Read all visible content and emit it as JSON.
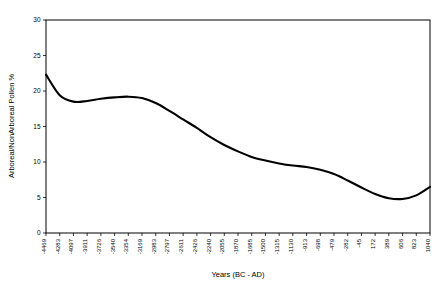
{
  "chart_data": {
    "type": "line",
    "title": "",
    "subtitle": "",
    "xlabel": "Years (BC - AD)",
    "ylabel": "Arboreal/NonArboreal Pollen %",
    "ylim": [
      0,
      30
    ],
    "yticks": [
      0,
      5,
      10,
      15,
      20,
      25,
      30
    ],
    "ytick_labels": [
      "0",
      "5",
      "10",
      "15",
      "20",
      "25",
      "30"
    ],
    "grid": false,
    "legend": "none",
    "line_color": "#000000",
    "background_color": "#ffffff",
    "categories": [
      "-4469",
      "-4283",
      "-4097",
      "-3911",
      "-3726",
      "-3540",
      "-3354",
      "-3169",
      "-2983",
      "-2797",
      "-2611",
      "-2426",
      "-2240",
      "-2055",
      "-1870",
      "-1685",
      "-1500",
      "-1315",
      "-1130",
      "-913",
      "-698",
      "-479",
      "-282",
      "-45",
      "172",
      "389",
      "606",
      "823",
      "1040"
    ],
    "values": [
      22.3,
      19.4,
      18.5,
      18.6,
      18.9,
      19.1,
      19.2,
      19.0,
      18.3,
      17.2,
      16.0,
      14.8,
      13.5,
      12.4,
      11.5,
      10.7,
      10.2,
      9.8,
      9.5,
      9.3,
      8.9,
      8.3,
      7.4,
      6.4,
      5.5,
      4.9,
      4.8,
      5.3,
      6.5
    ],
    "series": [
      {
        "name": "Arboreal/NonArboreal Pollen %",
        "values": [
          22.3,
          19.4,
          18.5,
          18.6,
          18.9,
          19.1,
          19.2,
          19.0,
          18.3,
          17.2,
          16.0,
          14.8,
          13.5,
          12.4,
          11.5,
          10.7,
          10.2,
          9.8,
          9.5,
          9.3,
          8.9,
          8.3,
          7.4,
          6.4,
          5.5,
          4.9,
          4.8,
          5.3,
          6.5
        ]
      }
    ]
  },
  "axes": {
    "x_title": "Years (BC - AD)",
    "y_title": "Arboreal/NonArboreal Pollen %"
  }
}
